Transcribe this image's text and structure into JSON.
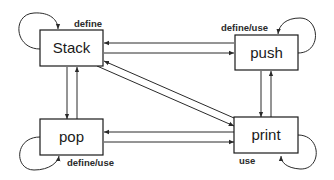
{
  "diagram": {
    "type": "state-transition",
    "colors": {
      "stroke": "#1a1a1a",
      "background": "#ffffff",
      "text": "#1a1a1a"
    },
    "nodes": {
      "stack": {
        "label": "Stack",
        "self_loop_label": "define"
      },
      "push": {
        "label": "push",
        "self_loop_label": "define/use"
      },
      "pop": {
        "label": "pop",
        "self_loop_label": "define/use"
      },
      "print": {
        "label": "print",
        "self_loop_label": "use"
      }
    },
    "edges": [
      {
        "from": "Stack",
        "to": "Stack"
      },
      {
        "from": "push",
        "to": "push"
      },
      {
        "from": "pop",
        "to": "pop"
      },
      {
        "from": "print",
        "to": "print"
      },
      {
        "from": "Stack",
        "to": "push"
      },
      {
        "from": "push",
        "to": "Stack"
      },
      {
        "from": "Stack",
        "to": "pop"
      },
      {
        "from": "pop",
        "to": "Stack"
      },
      {
        "from": "Stack",
        "to": "print"
      },
      {
        "from": "print",
        "to": "Stack"
      },
      {
        "from": "push",
        "to": "print"
      },
      {
        "from": "print",
        "to": "push"
      },
      {
        "from": "pop",
        "to": "print"
      },
      {
        "from": "print",
        "to": "pop"
      }
    ]
  }
}
